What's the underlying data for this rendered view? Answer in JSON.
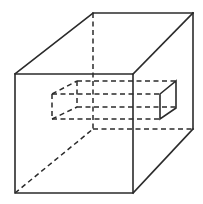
{
  "figure": {
    "title": "Cube with rectangular prism passing through it",
    "colors": {
      "line": "#2b2b2b",
      "background": "#ffffff"
    },
    "cube": {
      "front_face": {
        "tl": [
          15,
          74
        ],
        "tr": [
          133,
          74
        ],
        "br": [
          133,
          193
        ],
        "bl": [
          15,
          193
        ]
      },
      "back_face": {
        "tl": [
          93,
          13
        ],
        "tr": [
          193,
          13
        ],
        "br": [
          193,
          129
        ],
        "bl": [
          93,
          129
        ]
      }
    },
    "prism": {
      "left_front": {
        "top": [
          52,
          94
        ],
        "bottom": [
          52,
          119
        ]
      },
      "left_back": {
        "top": [
          77,
          81
        ],
        "bottom": [
          77,
          107
        ]
      },
      "right_front": {
        "top": [
          160,
          94
        ],
        "bottom": [
          160,
          119
        ]
      },
      "right_back": {
        "top": [
          176,
          81
        ],
        "bottom": [
          176,
          108
        ]
      }
    }
  }
}
